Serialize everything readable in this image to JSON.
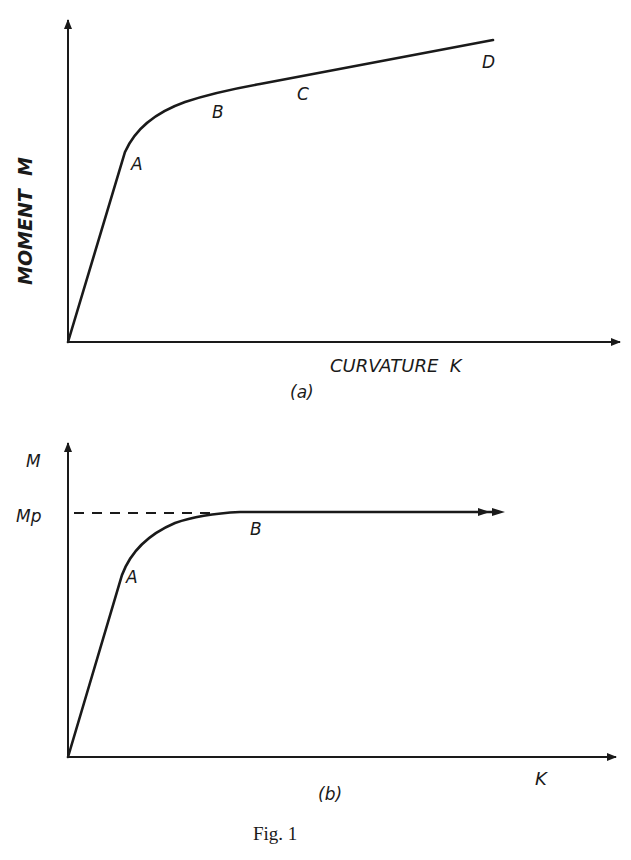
{
  "figure": {
    "caption": "Fig. 1",
    "panel_a": {
      "label": "(a)",
      "y_axis_label": "MOMENT  M",
      "x_axis_label": "CURVATURE  K",
      "points": [
        "A",
        "B",
        "C",
        "D"
      ]
    },
    "panel_b": {
      "label": "(b)",
      "y_axis_label": "M",
      "x_axis_label": "K",
      "mp_label": "Mp",
      "points": [
        "A",
        "B"
      ]
    },
    "colors": {
      "ink": "#1a1a1a",
      "background": "#ffffff"
    }
  }
}
